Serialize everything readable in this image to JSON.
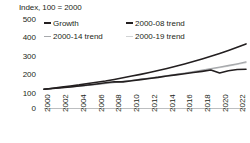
{
  "chart_data": {
    "type": "line",
    "title": "Index, 100 = 2000",
    "xlabel": "",
    "ylabel": "Index, 100 = 2000",
    "ylim": [
      0,
      500
    ],
    "yticks": [
      500,
      400,
      300,
      200,
      100,
      0
    ],
    "xlim": [
      2000,
      2023
    ],
    "xticks": [
      2000,
      2002,
      2004,
      2006,
      2008,
      2010,
      2012,
      2014,
      2016,
      2018,
      2020,
      2022
    ],
    "grid": false,
    "legend_position": "top-left",
    "x": [
      2000,
      2001,
      2002,
      2003,
      2004,
      2005,
      2006,
      2007,
      2008,
      2009,
      2010,
      2011,
      2012,
      2013,
      2014,
      2015,
      2016,
      2017,
      2018,
      2019,
      2020,
      2021,
      2022,
      2023
    ],
    "series": [
      {
        "name": "Growth",
        "color": "#231f20",
        "width": 1.6,
        "values": [
          100,
          104,
          108,
          112,
          117,
          122,
          128,
          134,
          140,
          139,
          145,
          151,
          157,
          163,
          170,
          176,
          182,
          189,
          195,
          202,
          186,
          198,
          205,
          206
        ]
      },
      {
        "name": "2000-08 trend",
        "color": "#231f20",
        "width": 1.6,
        "values": [
          100,
          105,
          111,
          117,
          123,
          130,
          137,
          144,
          152,
          161,
          170,
          179,
          189,
          199,
          210,
          222,
          234,
          247,
          261,
          275,
          290,
          306,
          323,
          341
        ]
      },
      {
        "name": "2000-14 trend",
        "color": "#a7a9ac",
        "width": 1.3,
        "values": [
          100,
          104,
          108,
          112,
          117,
          121,
          126,
          131,
          136,
          142,
          147,
          153,
          159,
          166,
          172,
          179,
          186,
          194,
          201,
          209,
          218,
          226,
          235,
          245
        ]
      },
      {
        "name": "2000-19 trend",
        "color": "#d1d3d4",
        "width": 1.3,
        "values": [
          100,
          104,
          108,
          112,
          116,
          121,
          125,
          130,
          135,
          141,
          146,
          152,
          158,
          164,
          170,
          177,
          184,
          191,
          199,
          207,
          215,
          223,
          232,
          241
        ]
      }
    ],
    "annotations": [
      {
        "label": "2020 downturn dip in Growth series",
        "x": 2020,
        "y": 186
      }
    ]
  },
  "legend": {
    "items": [
      {
        "label": "Growth",
        "color": "#231f20"
      },
      {
        "label": "2000-08 trend",
        "color": "#231f20"
      },
      {
        "label": "2000-14 trend",
        "color": "#a7a9ac"
      },
      {
        "label": "2000-19 trend",
        "color": "#d1d3d4"
      }
    ]
  },
  "axis": {
    "title": "Index, 100 = 2000",
    "y_labels": [
      "500",
      "400",
      "300",
      "200",
      "100",
      "0"
    ],
    "x_labels": [
      "2000",
      "2002",
      "2004",
      "2006",
      "2008",
      "2010",
      "2012",
      "2014",
      "2016",
      "2018",
      "2020",
      "2022"
    ]
  },
  "colors": {
    "text": "#231f20",
    "axis_line": "#bcbec0",
    "dark_series": "#231f20",
    "mid_gray_series": "#a7a9ac",
    "light_gray_series": "#d1d3d4",
    "background": "#ffffff"
  }
}
